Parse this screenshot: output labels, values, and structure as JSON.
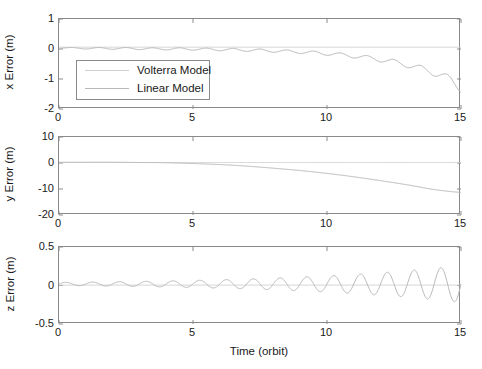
{
  "figure": {
    "background_color": "#ffffff",
    "axis_color": "#8a8a8a",
    "text_color": "#1a1a1a",
    "width": 482,
    "height": 369
  },
  "legend": {
    "entries": [
      {
        "label": "Volterra Model",
        "color": "#d0d0d0"
      },
      {
        "label": "Linear Model",
        "color": "#b8b8b8"
      }
    ]
  },
  "chart_data": [
    {
      "type": "line",
      "title": "",
      "xlabel": "",
      "ylabel": "x Error (m)",
      "xlim": [
        0,
        15
      ],
      "ylim": [
        -2,
        1
      ],
      "xticks": [
        0,
        5,
        10,
        15
      ],
      "xtick_labels": [
        "0",
        "5",
        "10",
        "15"
      ],
      "yticks": [
        1,
        0,
        -1,
        -2
      ],
      "ytick_labels": [
        "1",
        "0",
        "-1",
        "-2"
      ],
      "grid": false,
      "legend_position": "lower-left-inside",
      "series": [
        {
          "name": "Volterra Model",
          "color": "#d0d0d0",
          "x": [
            0,
            1,
            2,
            3,
            4,
            5,
            6,
            7,
            8,
            9,
            10,
            11,
            12,
            13,
            14,
            15
          ],
          "values": [
            0.06,
            0.06,
            0.06,
            0.06,
            0.06,
            0.06,
            0.06,
            0.06,
            0.06,
            0.06,
            0.06,
            0.06,
            0.06,
            0.06,
            0.06,
            0.06
          ]
        },
        {
          "name": "Linear Model",
          "color": "#b8b8b8",
          "x": [
            0,
            0.5,
            1,
            1.5,
            2,
            2.5,
            3,
            3.5,
            4,
            4.5,
            5,
            5.5,
            6,
            6.5,
            7,
            7.5,
            8,
            8.5,
            9,
            9.5,
            10,
            10.5,
            11,
            11.5,
            12,
            12.5,
            13,
            13.5,
            14,
            14.5,
            15
          ],
          "values": [
            0.02,
            0.05,
            0.0,
            0.05,
            -0.01,
            0.05,
            -0.02,
            0.04,
            -0.03,
            0.04,
            -0.04,
            0.03,
            -0.06,
            0.02,
            -0.08,
            0.0,
            -0.11,
            -0.03,
            -0.15,
            -0.07,
            -0.21,
            -0.13,
            -0.3,
            -0.22,
            -0.43,
            -0.35,
            -0.62,
            -0.55,
            -0.9,
            -0.85,
            -1.45
          ]
        }
      ]
    },
    {
      "type": "line",
      "title": "",
      "xlabel": "",
      "ylabel": "y Error (m)",
      "xlim": [
        0,
        15
      ],
      "ylim": [
        -20,
        10
      ],
      "xticks": [
        0,
        5,
        10,
        15
      ],
      "xtick_labels": [
        "0",
        "5",
        "10",
        "15"
      ],
      "yticks": [
        10,
        0,
        -10,
        -20
      ],
      "ytick_labels": [
        "10",
        "0",
        "-10",
        "-20"
      ],
      "grid": false,
      "series": [
        {
          "name": "Volterra Model",
          "color": "#d0d0d0",
          "x": [
            0,
            1,
            2,
            3,
            4,
            5,
            6,
            7,
            8,
            9,
            10,
            11,
            12,
            13,
            14,
            15
          ],
          "values": [
            0.2,
            0.2,
            0.2,
            0.2,
            0.2,
            0.2,
            0.2,
            0.2,
            0.2,
            0.2,
            0.2,
            0.2,
            0.2,
            0.2,
            0.2,
            0.2
          ]
        },
        {
          "name": "Linear Model",
          "color": "#b8b8b8",
          "x": [
            0,
            1,
            2,
            3,
            4,
            5,
            6,
            7,
            8,
            9,
            10,
            11,
            12,
            13,
            14,
            15
          ],
          "values": [
            0.3,
            0.3,
            0.3,
            0.2,
            0.1,
            -0.2,
            -0.6,
            -1.2,
            -2.0,
            -2.9,
            -4.0,
            -5.3,
            -6.8,
            -8.4,
            -10.2,
            -11.3
          ]
        }
      ]
    },
    {
      "type": "line",
      "title": "",
      "xlabel": "Time (orbit)",
      "ylabel": "z Error (m)",
      "xlim": [
        0,
        15
      ],
      "ylim": [
        -0.5,
        0.5
      ],
      "xticks": [
        0,
        5,
        10,
        15
      ],
      "xtick_labels": [
        "0",
        "5",
        "10",
        "15"
      ],
      "yticks": [
        0.5,
        0,
        -0.5
      ],
      "ytick_labels": [
        "0.5",
        "0",
        "-0.5"
      ],
      "grid": false,
      "series": [
        {
          "name": "Volterra Model",
          "color": "#d0d0d0",
          "x": [
            0,
            3,
            6,
            9,
            12,
            15
          ],
          "values": [
            0.005,
            0.005,
            0.005,
            0.005,
            0.005,
            0.005
          ]
        },
        {
          "name": "Linear Model",
          "color": "#b8b8b8",
          "description": "Growing sinusoidal oscillation, period ~1 orbit, amplitude grows from ~0.02 m at t=0 to ~0.24 m at t=15, centered near 0.02 m",
          "oscillation": {
            "period_orbits": 1.0,
            "amplitude_start": 0.02,
            "amplitude_end": 0.24,
            "growth": "exponential",
            "offset": 0.02,
            "phase_deg": 0
          }
        }
      ]
    }
  ]
}
